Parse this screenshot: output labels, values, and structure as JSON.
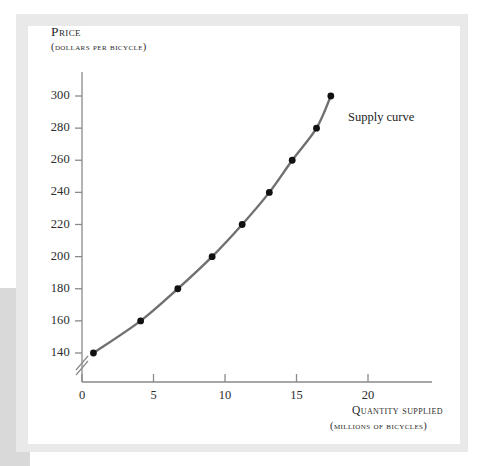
{
  "figure": {
    "axis_titles": {
      "y_title": "Price",
      "y_subtitle": "(dollars per bicycle)",
      "x_title": "Quantity supplied",
      "x_subtitle": "(millions of bicycles)"
    },
    "curve_label": "Supply curve",
    "colors": {
      "curve": "#707070",
      "point": "#111111",
      "axis": "#8a8a8a",
      "text": "#2b2b2b",
      "frame": "#e9e9e9",
      "side_block": "#d9d9d9",
      "background": "#ffffff"
    }
  },
  "chart_data": {
    "type": "line",
    "title": "",
    "xlabel": "Quantity supplied (millions of bicycles)",
    "ylabel": "Price (dollars per bicycle)",
    "xlim": [
      0,
      23
    ],
    "ylim": [
      130,
      310
    ],
    "y_axis_break": true,
    "grid": false,
    "legend_position": "inline-right",
    "xticks": [
      0,
      5,
      10,
      15,
      20
    ],
    "xtick_labels": [
      "0",
      "5",
      "10",
      "15",
      "20"
    ],
    "yticks": [
      140,
      160,
      180,
      200,
      220,
      240,
      260,
      280,
      300
    ],
    "ytick_labels": [
      "140",
      "160",
      "180",
      "200",
      "220",
      "240",
      "260",
      "280",
      "300"
    ],
    "series": [
      {
        "name": "Supply curve",
        "x": [
          0.8,
          4.1,
          6.7,
          9.1,
          11.2,
          13.1,
          14.7,
          16.4,
          17.4
        ],
        "y": [
          140,
          160,
          180,
          200,
          220,
          240,
          260,
          280,
          300
        ],
        "markers": true
      }
    ]
  }
}
